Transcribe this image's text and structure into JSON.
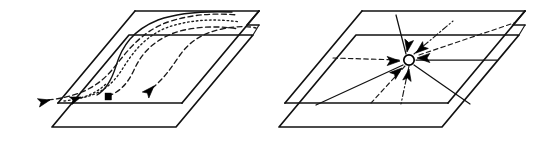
{
  "figure": {
    "background_color": "#ffffff",
    "ink_color": "#111111",
    "width": 547,
    "height": 141,
    "panel_count": 2
  },
  "panels": [
    {
      "id": "left-panel",
      "name": "divergent-trajectories-panel",
      "caption": "",
      "description": "Two parallel planes in perspective with curved dashed and dotted trajectories fanning from the near lower edge toward the far upper edge",
      "upper_plane": {
        "name": "upper-plane",
        "corners": [
          {
            "label": "near-left",
            "x": 58,
            "y": 103
          },
          {
            "label": "far-left",
            "x": 135,
            "y": 11
          },
          {
            "label": "far-right",
            "x": 259,
            "y": 11
          },
          {
            "label": "near-right",
            "x": 182,
            "y": 103
          }
        ]
      },
      "lower_plane": {
        "name": "lower-plane",
        "corners": [
          {
            "label": "near-left",
            "x": 52,
            "y": 127
          },
          {
            "label": "far-left",
            "x": 129,
            "y": 35
          },
          {
            "label": "far-right",
            "x": 253,
            "y": 35
          },
          {
            "label": "near-right",
            "x": 176,
            "y": 127
          }
        ]
      },
      "notch": {
        "name": "right-edge-notch",
        "description": "Stepped notch where the two plane sheets separate on the right side"
      },
      "trajectories": [
        {
          "id": "traj-1",
          "style": "dashed",
          "origin_marker": "arrowhead",
          "origin": {
            "x": 47,
            "y": 101
          }
        },
        {
          "id": "traj-2",
          "style": "dotted",
          "origin_marker": "arrowhead",
          "origin": {
            "x": 79,
            "y": 99
          }
        },
        {
          "id": "traj-3",
          "style": "dashed",
          "origin_marker": "square",
          "origin": {
            "x": 108,
            "y": 99
          }
        },
        {
          "id": "traj-4",
          "style": "solid",
          "origin_marker": "arrowhead",
          "origin": {
            "x": 151,
            "y": 89
          }
        },
        {
          "id": "traj-5",
          "style": "dashed",
          "origin_marker": "none",
          "origin": {
            "x": 96,
            "y": 96
          }
        }
      ],
      "markers": [
        {
          "id": "marker-1",
          "type": "arrowhead",
          "x": 47,
          "y": 101
        },
        {
          "id": "marker-2",
          "type": "arrowhead",
          "x": 79,
          "y": 99
        },
        {
          "id": "marker-3",
          "type": "square-block",
          "x": 108,
          "y": 97
        },
        {
          "id": "marker-4",
          "type": "arrowhead",
          "x": 151,
          "y": 89
        }
      ]
    },
    {
      "id": "right-panel",
      "name": "radial-convergence-panel",
      "caption": "",
      "description": "Two parallel planes in perspective with a radial star of straight rays converging on an open circular node carrying inward arrowheads",
      "upper_plane": {
        "name": "upper-plane",
        "corners": [
          {
            "label": "near-left",
            "x": 285,
            "y": 103
          },
          {
            "label": "far-left",
            "x": 362,
            "y": 11
          },
          {
            "label": "far-right",
            "x": 525,
            "y": 11
          },
          {
            "label": "near-right",
            "x": 448,
            "y": 103
          }
        ]
      },
      "lower_plane": {
        "name": "lower-plane",
        "corners": [
          {
            "label": "near-left",
            "x": 279,
            "y": 127
          },
          {
            "label": "far-left",
            "x": 356,
            "y": 35
          },
          {
            "label": "far-right",
            "x": 519,
            "y": 35
          },
          {
            "label": "near-right",
            "x": 442,
            "y": 127
          }
        ]
      },
      "notch": {
        "name": "right-edge-notch",
        "description": "Stepped notch where the two plane sheets separate on the right side"
      },
      "center_node": {
        "name": "convergence-node",
        "type": "open-circle",
        "x": 409,
        "y": 60,
        "radius": 5.2,
        "fill": "#ffffff",
        "stroke": "#000000"
      },
      "rays": [
        {
          "id": "ray-1",
          "style": "solid",
          "angle_label": "east",
          "to": {
            "x": 497,
            "y": 60
          }
        },
        {
          "id": "ray-2",
          "style": "dashed",
          "angle_label": "west",
          "to": {
            "x": 333,
            "y": 58
          }
        },
        {
          "id": "ray-3",
          "style": "solid",
          "angle_label": "north",
          "to": {
            "x": 399,
            "y": 16
          }
        },
        {
          "id": "ray-4",
          "style": "dash-dot",
          "angle_label": "north-east",
          "to": {
            "x": 452,
            "y": 22
          }
        },
        {
          "id": "ray-5",
          "style": "dashed",
          "angle_label": "east-upper",
          "to": {
            "x": 512,
            "y": 24
          }
        },
        {
          "id": "ray-6",
          "style": "solid",
          "angle_label": "south-west",
          "to": {
            "x": 318,
            "y": 104
          }
        },
        {
          "id": "ray-7",
          "style": "dashed",
          "angle_label": "south",
          "to": {
            "x": 372,
            "y": 102
          }
        },
        {
          "id": "ray-8",
          "style": "dash-dot",
          "angle_label": "south-south",
          "to": {
            "x": 401,
            "y": 103
          }
        },
        {
          "id": "ray-9",
          "style": "solid",
          "angle_label": "south-east",
          "to": {
            "x": 471,
            "y": 103
          }
        }
      ],
      "arrowheads": [
        {
          "id": "arrow-in-w",
          "direction": "pointing-east-into-node",
          "x": 393,
          "y": 61
        },
        {
          "id": "arrow-in-e",
          "direction": "pointing-west-into-node",
          "x": 425,
          "y": 57
        },
        {
          "id": "arrow-in-n",
          "direction": "pointing-south-into-node",
          "x": 404,
          "y": 47
        },
        {
          "id": "arrow-in-ne",
          "direction": "pointing-south-west-into-node",
          "x": 421,
          "y": 50
        },
        {
          "id": "arrow-in-sw",
          "direction": "pointing-north-east-into-node",
          "x": 396,
          "y": 71
        },
        {
          "id": "arrow-in-s",
          "direction": "pointing-north-into-node",
          "x": 409,
          "y": 73
        }
      ]
    }
  ]
}
